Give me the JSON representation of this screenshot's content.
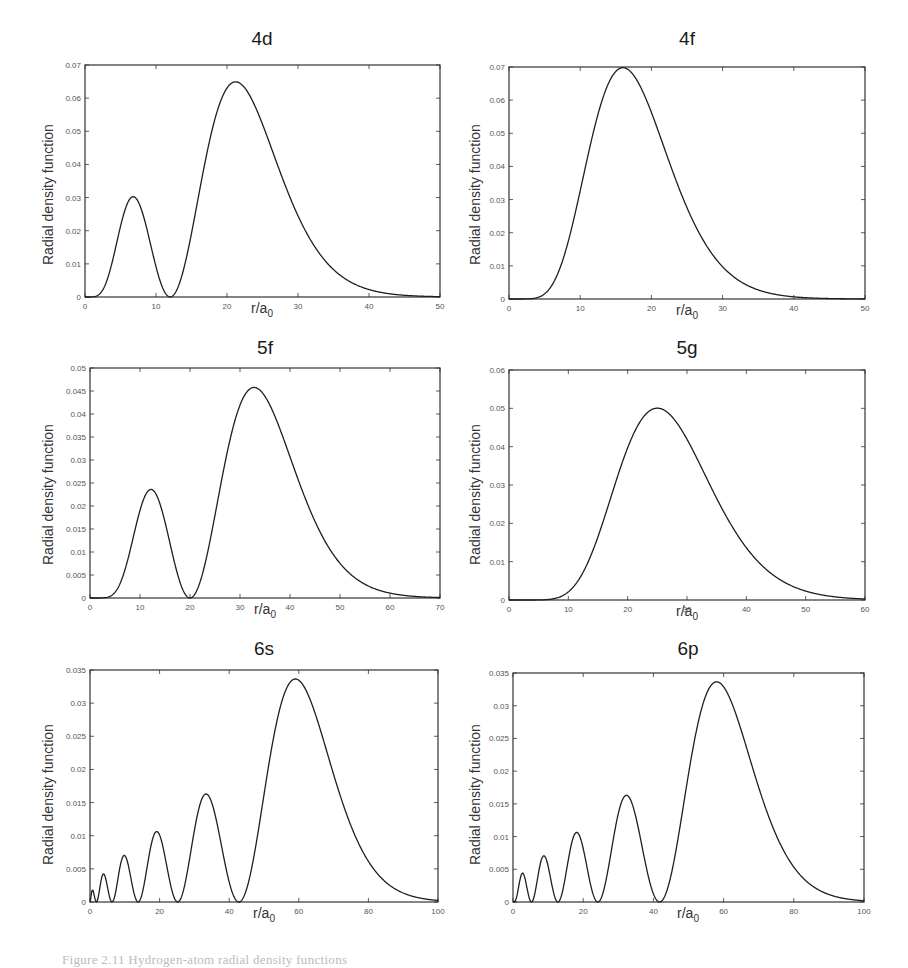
{
  "figure": {
    "caption": "Figure 2.11 Hydrogen-atom radial density functions"
  },
  "chart_data": [
    {
      "id": "4d",
      "type": "line",
      "title": "4d",
      "n": 4,
      "l": 2,
      "xlabel": "r/a0",
      "xlabel_main": "r/a",
      "xlabel_sub": "0",
      "ylabel": "Radial density function",
      "xlim": [
        0,
        50
      ],
      "ylim": [
        0,
        0.07
      ],
      "xticks": [
        0,
        10,
        20,
        30,
        40,
        50
      ],
      "yticks": [
        0,
        0.01,
        0.02,
        0.03,
        0.04,
        0.05,
        0.06,
        0.07
      ],
      "ytick_labels": [
        "0",
        "0.01",
        "0.02",
        "0.03",
        "0.04",
        "0.05",
        "0.06",
        "0.07"
      ],
      "grid": false,
      "legend": null,
      "peaks": [
        {
          "x": 6.6,
          "y": 0.03
        },
        {
          "x": 21.4,
          "y": 0.065
        }
      ],
      "nodes": [
        12
      ],
      "x": [
        0,
        2.5,
        5,
        7.5,
        10,
        12.5,
        15,
        17.5,
        20,
        22.5,
        25,
        27.5,
        30,
        32.5,
        35,
        37.5,
        40,
        42.5,
        45,
        47.5,
        50
      ],
      "values": [
        0,
        0.0021,
        0.0224,
        0.0292,
        0.0097,
        0.0001,
        0.0181,
        0.0482,
        0.064,
        0.0634,
        0.0525,
        0.0384,
        0.0256,
        0.0158,
        0.0092,
        0.0051,
        0.0027,
        0.0014,
        0.0007,
        0.0003,
        0.0002
      ],
      "frame": {
        "left": 85,
        "top": 65,
        "right": 440,
        "bottom": 297
      },
      "title_pos": {
        "x": 262,
        "y": 28
      },
      "xlabel_pos": {
        "x": 262,
        "y": 300
      },
      "ylabel_pos": {
        "x": 40,
        "y": 265
      }
    },
    {
      "id": "4f",
      "type": "line",
      "title": "4f",
      "n": 4,
      "l": 3,
      "xlabel": "r/a0",
      "xlabel_main": "r/a",
      "xlabel_sub": "0",
      "ylabel": "Radial density function",
      "xlim": [
        0,
        50
      ],
      "ylim": [
        0,
        0.07
      ],
      "xticks": [
        0,
        10,
        20,
        30,
        40,
        50
      ],
      "yticks": [
        0,
        0.01,
        0.02,
        0.03,
        0.04,
        0.05,
        0.06,
        0.07
      ],
      "ytick_labels": [
        "0",
        "0.01",
        "0.02",
        "0.03",
        "0.04",
        "0.05",
        "0.06",
        "0.07"
      ],
      "grid": false,
      "legend": null,
      "peaks": [
        {
          "x": 16,
          "y": 0.07
        }
      ],
      "nodes": [],
      "x": [
        0,
        2.5,
        5,
        7.5,
        10,
        12.5,
        15,
        17.5,
        20,
        22.5,
        25,
        27.5,
        30,
        32.5,
        35,
        37.5,
        40,
        42.5,
        45,
        47.5,
        50
      ],
      "values": [
        0,
        0.0001,
        0.0024,
        0.0144,
        0.0367,
        0.0584,
        0.0693,
        0.0677,
        0.0569,
        0.0427,
        0.0292,
        0.0186,
        0.0111,
        0.0063,
        0.0034,
        0.0018,
        0.0009,
        0.0004,
        0.0002,
        0.0001,
        0.0
      ],
      "frame": {
        "left": 509,
        "top": 67,
        "right": 865,
        "bottom": 299
      },
      "title_pos": {
        "x": 687,
        "y": 28
      },
      "xlabel_pos": {
        "x": 687,
        "y": 302
      },
      "ylabel_pos": {
        "x": 467,
        "y": 265
      }
    },
    {
      "id": "5f",
      "type": "line",
      "title": "5f",
      "n": 5,
      "l": 3,
      "xlabel": "r/a0",
      "xlabel_main": "r/a",
      "xlabel_sub": "0",
      "ylabel": "Radial density function",
      "xlim": [
        0,
        70
      ],
      "ylim": [
        0,
        0.05
      ],
      "xticks": [
        0,
        10,
        20,
        30,
        40,
        50,
        60,
        70
      ],
      "yticks": [
        0,
        0.005,
        0.01,
        0.015,
        0.02,
        0.025,
        0.03,
        0.035,
        0.04,
        0.045,
        0.05
      ],
      "ytick_labels": [
        "0",
        "0.005",
        "0.01",
        "0.015",
        "0.02",
        "0.025",
        "0.03",
        "0.035",
        "0.04",
        "0.045",
        "0.05"
      ],
      "grid": false,
      "legend": null,
      "peaks": [
        {
          "x": 12.2,
          "y": 0.0235
        },
        {
          "x": 32.8,
          "y": 0.0455
        }
      ],
      "nodes": [
        20
      ],
      "x": [
        0,
        5,
        7.5,
        10,
        12.5,
        15,
        17.5,
        20,
        22.5,
        25,
        27.5,
        30,
        32.5,
        35,
        37.5,
        40,
        45,
        50,
        55,
        60,
        65,
        70
      ],
      "values": [
        0,
        0.001,
        0.0076,
        0.019,
        0.0234,
        0.0164,
        0.0045,
        0.0,
        0.0043,
        0.0179,
        0.0334,
        0.0437,
        0.0455,
        0.0425,
        0.0357,
        0.0278,
        0.0141,
        0.006,
        0.0023,
        0.0008,
        0.0002,
        0.0001
      ],
      "frame": {
        "left": 90,
        "top": 368,
        "right": 440,
        "bottom": 598
      },
      "title_pos": {
        "x": 265,
        "y": 337
      },
      "xlabel_pos": {
        "x": 265,
        "y": 601
      },
      "ylabel_pos": {
        "x": 40,
        "y": 565
      }
    },
    {
      "id": "5g",
      "type": "line",
      "title": "5g",
      "n": 5,
      "l": 4,
      "xlabel": "r/a0",
      "xlabel_main": "r/a",
      "xlabel_sub": "0",
      "ylabel": "Radial density function",
      "xlim": [
        0,
        60
      ],
      "ylim": [
        0,
        0.06
      ],
      "xticks": [
        0,
        10,
        20,
        30,
        40,
        50,
        60
      ],
      "yticks": [
        0,
        0.01,
        0.02,
        0.03,
        0.04,
        0.05,
        0.06
      ],
      "ytick_labels": [
        "0",
        "0.01",
        "0.02",
        "0.03",
        "0.04",
        "0.05",
        "0.06"
      ],
      "grid": false,
      "legend": null,
      "peaks": [
        {
          "x": 25,
          "y": 0.05
        }
      ],
      "nodes": [],
      "x": [
        0,
        5,
        7.5,
        10,
        12.5,
        15,
        17.5,
        20,
        22.5,
        25,
        27.5,
        30,
        32.5,
        35,
        37.5,
        40,
        45,
        50,
        55,
        60
      ],
      "values": [
        0,
        0.0001,
        0.0009,
        0.0038,
        0.0101,
        0.0196,
        0.0302,
        0.0398,
        0.0465,
        0.0496,
        0.0487,
        0.0445,
        0.038,
        0.0305,
        0.0232,
        0.0168,
        0.0078,
        0.0032,
        0.0012,
        0.0004
      ],
      "frame": {
        "left": 509,
        "top": 370,
        "right": 865,
        "bottom": 600
      },
      "title_pos": {
        "x": 687,
        "y": 337
      },
      "xlabel_pos": {
        "x": 687,
        "y": 603
      },
      "ylabel_pos": {
        "x": 467,
        "y": 565
      }
    },
    {
      "id": "6s",
      "type": "line",
      "title": "6s",
      "n": 6,
      "l": 0,
      "xlabel": "r/a0",
      "xlabel_main": "r/a",
      "xlabel_sub": "0",
      "ylabel": "Radial density function",
      "xlim": [
        0,
        100
      ],
      "ylim": [
        0,
        0.035
      ],
      "xticks": [
        0,
        20,
        40,
        60,
        80,
        100
      ],
      "yticks": [
        0,
        0.005,
        0.01,
        0.015,
        0.02,
        0.025,
        0.03,
        0.035
      ],
      "ytick_labels": [
        "0",
        "0.005",
        "0.01",
        "0.015",
        "0.02",
        "0.025",
        "0.03",
        "0.035"
      ],
      "grid": false,
      "legend": null,
      "peaks": [
        {
          "x": 0.6,
          "y": 0.0018
        },
        {
          "x": 3.8,
          "y": 0.0042
        },
        {
          "x": 9.5,
          "y": 0.0071
        },
        {
          "x": 19.2,
          "y": 0.0106
        },
        {
          "x": 33.4,
          "y": 0.0162
        },
        {
          "x": 59.2,
          "y": 0.0334
        }
      ],
      "nodes": [
        1.9,
        6.6,
        13.8,
        25.2,
        42.5
      ],
      "x": [
        0,
        0.6,
        1.9,
        3.8,
        6.6,
        9.5,
        13.8,
        19.2,
        25.2,
        33.4,
        42.5,
        50,
        55,
        59.2,
        65,
        70,
        75,
        80,
        85,
        90,
        95,
        100
      ],
      "values": [
        0,
        0.0018,
        0,
        0.0042,
        0,
        0.0071,
        0,
        0.0106,
        0,
        0.0162,
        0,
        0.0224,
        0.0313,
        0.0334,
        0.029,
        0.0207,
        0.0128,
        0.007,
        0.0035,
        0.0016,
        0.0007,
        0.0003
      ],
      "frame": {
        "left": 90,
        "top": 670,
        "right": 438,
        "bottom": 902
      },
      "title_pos": {
        "x": 264,
        "y": 638
      },
      "xlabel_pos": {
        "x": 264,
        "y": 905
      },
      "ylabel_pos": {
        "x": 40,
        "y": 865
      }
    },
    {
      "id": "6p",
      "type": "line",
      "title": "6p",
      "n": 6,
      "l": 1,
      "xlabel": "r/a0",
      "xlabel_main": "r/a",
      "xlabel_sub": "0",
      "ylabel": "Radial density function",
      "xlim": [
        0,
        100
      ],
      "ylim": [
        0,
        0.035
      ],
      "xticks": [
        0,
        20,
        40,
        60,
        80,
        100
      ],
      "yticks": [
        0,
        0.005,
        0.01,
        0.015,
        0.02,
        0.025,
        0.03,
        0.035
      ],
      "ytick_labels": [
        "0",
        "0.005",
        "0.01",
        "0.015",
        "0.02",
        "0.025",
        "0.03",
        "0.035"
      ],
      "grid": false,
      "legend": null,
      "peaks": [
        {
          "x": 2.4,
          "y": 0.0044
        },
        {
          "x": 8.4,
          "y": 0.007
        },
        {
          "x": 18.0,
          "y": 0.0105
        },
        {
          "x": 32.2,
          "y": 0.0161
        },
        {
          "x": 58.0,
          "y": 0.0334
        }
      ],
      "nodes": [
        5.0,
        12.4,
        24.2,
        41.4
      ],
      "x": [
        0,
        2.4,
        5.0,
        8.4,
        12.4,
        18.0,
        24.2,
        32.2,
        41.4,
        50,
        55,
        58,
        65,
        70,
        75,
        80,
        85,
        90,
        95,
        100
      ],
      "values": [
        0,
        0.0044,
        0,
        0.007,
        0,
        0.0105,
        0,
        0.0161,
        0,
        0.0252,
        0.0324,
        0.0334,
        0.0277,
        0.0193,
        0.0118,
        0.0064,
        0.0031,
        0.0014,
        0.0006,
        0.0002
      ],
      "frame": {
        "left": 513,
        "top": 673,
        "right": 864,
        "bottom": 902
      },
      "title_pos": {
        "x": 688,
        "y": 638
      },
      "xlabel_pos": {
        "x": 688,
        "y": 905
      },
      "ylabel_pos": {
        "x": 467,
        "y": 865
      }
    }
  ],
  "colors": {
    "curve": "#1f1f1f",
    "frame": "#333333",
    "tick_text": "#555555",
    "title": "#1a1a1a",
    "background": "#ffffff"
  }
}
